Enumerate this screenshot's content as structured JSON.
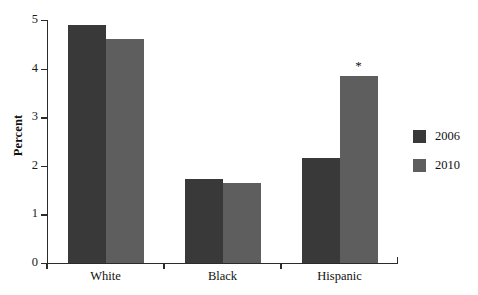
{
  "chart_data": {
    "type": "bar",
    "title": "",
    "subtitle": "",
    "xlabel": "",
    "ylabel": "Percent",
    "categories": [
      "White",
      "Black",
      "Hispanic"
    ],
    "series": [
      {
        "name": "2006",
        "color": "#393939",
        "values": [
          4.9,
          1.72,
          2.16
        ]
      },
      {
        "name": "2010",
        "color": "#5e5e5e",
        "values": [
          4.6,
          1.65,
          3.85
        ]
      }
    ],
    "ylim": [
      0,
      5
    ],
    "ytick_labels": [
      "0",
      "1",
      "2",
      "3",
      "4",
      "5"
    ],
    "ytick_values": [
      0,
      1,
      2,
      3,
      4,
      5
    ],
    "grid": false,
    "legend_position": "right",
    "annotations": [
      {
        "text": "*",
        "category": "Hispanic",
        "series": "2010"
      }
    ]
  },
  "legend": {
    "items": [
      {
        "label": "2006",
        "color": "#393939"
      },
      {
        "label": "2010",
        "color": "#5e5e5e"
      }
    ]
  },
  "axes": {
    "y_label": "Percent",
    "y_ticks": [
      "5",
      "4",
      "3",
      "2",
      "1",
      "0"
    ],
    "x_ticks": [
      "White",
      "Black",
      "Hispanic"
    ]
  },
  "colors": {
    "background": "#ffffff",
    "axis": "#2b2b2b",
    "text": "#111111",
    "series_2006": "#393939",
    "series_2010": "#5e5e5e"
  }
}
